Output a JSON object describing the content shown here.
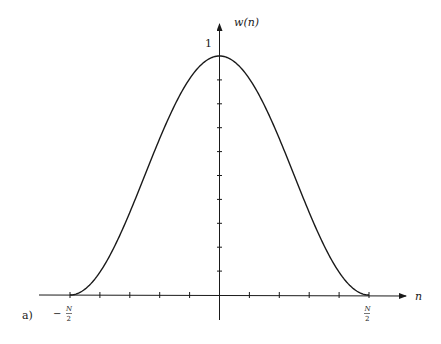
{
  "chart_data": {
    "type": "line",
    "title": "",
    "figure_label": "a)",
    "xlabel": "n",
    "ylabel": "w(n)",
    "function": "Hanning window w(n) = 0.5 * (1 + cos(2*pi*n/N)), -N/2 <= n <= N/2",
    "x_range_units_of_N": [
      -0.5,
      0.5
    ],
    "ylim": [
      0,
      1
    ],
    "x_tick_labels": [
      {
        "position_units_of_N": -0.5,
        "sign": "−",
        "numerator": "N",
        "denominator": "2"
      },
      {
        "position_units_of_N": 0.5,
        "sign": "",
        "numerator": "N",
        "denominator": "2"
      }
    ],
    "x_minor_ticks_units_of_N": [
      -0.5,
      -0.4,
      -0.3,
      -0.2,
      -0.1,
      0.1,
      0.2,
      0.3,
      0.4,
      0.5
    ],
    "y_tick_label": "1",
    "y_minor_ticks": [
      0.1,
      0.2,
      0.3,
      0.4,
      0.5,
      0.6,
      0.7,
      0.8,
      0.9
    ],
    "series": [
      {
        "name": "w(n)",
        "x_units_of_N": [
          -0.5,
          -0.4,
          -0.3,
          -0.2,
          -0.1,
          0.0,
          0.1,
          0.2,
          0.3,
          0.4,
          0.5
        ],
        "values": [
          0.0,
          0.095,
          0.345,
          0.655,
          0.905,
          1.0,
          0.905,
          0.655,
          0.345,
          0.095,
          0.0
        ]
      }
    ],
    "grid": false,
    "legend": "none",
    "line_color": "#1a1a1a"
  }
}
